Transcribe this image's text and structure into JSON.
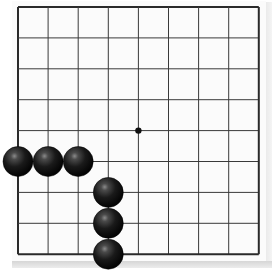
{
  "board": {
    "size": 9,
    "origin_x": 18,
    "origin_y": 7,
    "spacing_x": 30.1,
    "spacing_y": 30.9,
    "line_color": "#3a3a3a",
    "border_color": "#2a2a2a",
    "background": "#fbfbfb"
  },
  "star_points": [
    {
      "col": 4,
      "row": 4
    }
  ],
  "stones": [
    {
      "color": "black",
      "col": 0,
      "row": 5
    },
    {
      "color": "black",
      "col": 1,
      "row": 5
    },
    {
      "color": "black",
      "col": 2,
      "row": 5
    },
    {
      "color": "black",
      "col": 3,
      "row": 6
    },
    {
      "color": "black",
      "col": 3,
      "row": 7
    },
    {
      "color": "black",
      "col": 3,
      "row": 8
    }
  ],
  "colors": {
    "stone_black": "#111111",
    "stone_highlight": "#7a7a7a"
  }
}
